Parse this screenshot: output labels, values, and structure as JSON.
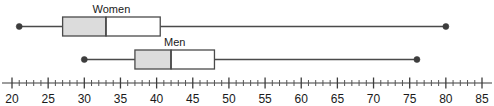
{
  "chart_data": {
    "type": "box",
    "title": "",
    "xlabel": "",
    "ylabel": "",
    "orientation": "horizontal",
    "xlim": [
      20,
      85
    ],
    "grid": false,
    "axis": {
      "min": 20,
      "max": 85,
      "major_step": 5,
      "minor_step": 1,
      "tick_labels": [
        "20",
        "25",
        "30",
        "35",
        "40",
        "45",
        "50",
        "55",
        "60",
        "65",
        "70",
        "75",
        "80",
        "85"
      ],
      "tick_values": [
        20,
        25,
        30,
        35,
        40,
        45,
        50,
        55,
        60,
        65,
        70,
        75,
        80,
        85
      ]
    },
    "series": [
      {
        "name": "Women",
        "label": "Women",
        "min": 21,
        "q1": 27,
        "median": 33,
        "q3": 40.5,
        "max": 80,
        "lower_box_fill": "#dcdcdc",
        "upper_box_fill": "#ffffff"
      },
      {
        "name": "Men",
        "label": "Men",
        "min": 30,
        "q1": 37,
        "median": 42,
        "q3": 48,
        "max": 76,
        "lower_box_fill": "#dcdcdc",
        "upper_box_fill": "#ffffff"
      }
    ],
    "colors": {
      "stroke": "#4a4a4a",
      "axis": "#3d3d3d",
      "text": "#1a1a1a",
      "box_shaded": "#dcdcdc",
      "box_plain": "#ffffff",
      "background": "#ffffff"
    }
  }
}
